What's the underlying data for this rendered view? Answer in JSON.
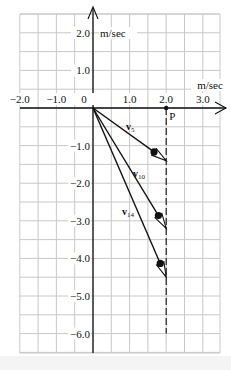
{
  "figure": {
    "type": "velocity-vector-diagram",
    "axes": {
      "x_unit_label": "m/sec",
      "y_unit_label": "m/sec",
      "x_tick_labels": [
        "−2.0",
        "−1.0",
        "0",
        "1.0",
        "2.0",
        "3.0"
      ],
      "y_tick_labels_positive": [
        "2.0",
        "1.0"
      ],
      "y_tick_labels_negative": [
        "−1.0",
        "−2.0",
        "−3.0",
        "−4.0",
        "−5.0",
        "−6.0"
      ],
      "x_range": [
        -2.0,
        3.5
      ],
      "y_range": [
        -6.5,
        2.5
      ],
      "grid": true,
      "grid_step": 0.5
    },
    "point": {
      "label": "P",
      "x": 2.0,
      "y": 0.0
    },
    "dashed_line": {
      "x": 2.0,
      "from_y": 0.0,
      "to_y": -6.0
    },
    "vectors": [
      {
        "label_main": "v",
        "label_sub": "5",
        "from": [
          0,
          0
        ],
        "to": [
          2.0,
          -1.4
        ],
        "dot": [
          1.6,
          -1.2
        ]
      },
      {
        "label_main": "v",
        "label_sub": "10",
        "from": [
          0,
          0
        ],
        "to": [
          2.0,
          -3.2
        ],
        "dot": [
          1.73,
          -2.9
        ]
      },
      {
        "label_main": "v",
        "label_sub": "14",
        "from": [
          0,
          0
        ],
        "to": [
          2.0,
          -4.5
        ],
        "dot": [
          1.78,
          -4.15
        ]
      }
    ],
    "colors": {
      "grid": "#c8c8c8",
      "ink": "#111111",
      "background": "#ffffff"
    }
  }
}
